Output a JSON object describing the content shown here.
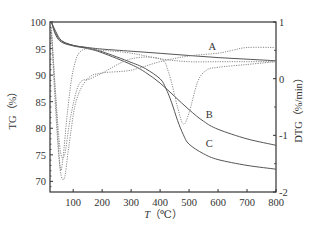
{
  "chart_data": {
    "type": "line",
    "title": "",
    "xlabel": "T (℃)",
    "ylabel": "TG (%)",
    "y2label": "DTG (%/min)",
    "xlim": [
      20,
      800
    ],
    "ylim": [
      68,
      100
    ],
    "y2lim": [
      -2,
      1
    ],
    "grid": false,
    "legend": "inline curve labels A, B, C",
    "x_ticks": [
      100,
      200,
      300,
      400,
      500,
      600,
      700,
      800
    ],
    "y_ticks": [
      70,
      75,
      80,
      85,
      90,
      95,
      100
    ],
    "y2_ticks": [
      -2,
      -1,
      0,
      1
    ],
    "series": [
      {
        "name": "A",
        "axis": "TG",
        "style": "solid",
        "x": [
          25,
          40,
          60,
          100,
          150,
          200,
          300,
          400,
          500,
          600,
          700,
          800
        ],
        "y": [
          100,
          98.2,
          96.5,
          95.6,
          95.2,
          94.9,
          94.5,
          94.1,
          93.7,
          93.3,
          93.0,
          92.7
        ]
      },
      {
        "name": "B",
        "axis": "TG",
        "style": "solid",
        "x": [
          25,
          40,
          60,
          100,
          150,
          200,
          300,
          350,
          400,
          450,
          500,
          550,
          600,
          700,
          800
        ],
        "y": [
          100,
          97.5,
          96.2,
          95.5,
          95.0,
          94.2,
          92.0,
          90.5,
          88.5,
          86.0,
          83.5,
          81.3,
          79.8,
          78.0,
          76.8
        ]
      },
      {
        "name": "C",
        "axis": "TG",
        "style": "solid",
        "x": [
          25,
          40,
          60,
          100,
          150,
          200,
          300,
          350,
          400,
          420,
          440,
          460,
          480,
          500,
          550,
          600,
          700,
          800
        ],
        "y": [
          100,
          97.8,
          96.4,
          95.6,
          95.1,
          94.4,
          92.4,
          91.2,
          89.3,
          87.5,
          84.8,
          81.5,
          78.8,
          77.0,
          75.2,
          74.1,
          73.0,
          72.3
        ]
      },
      {
        "name": "DTG-A",
        "axis": "DTG",
        "style": "dotted",
        "x": [
          25,
          40,
          55,
          65,
          80,
          100,
          130,
          200,
          300,
          400,
          500,
          600,
          700,
          800
        ],
        "y": [
          0.9,
          -0.4,
          -1.55,
          -1.4,
          -0.6,
          0.15,
          0.5,
          0.5,
          0.45,
          0.35,
          0.3,
          0.3,
          0.3,
          0.3
        ]
      },
      {
        "name": "DTG-B",
        "axis": "DTG",
        "style": "dotted",
        "x": [
          25,
          40,
          55,
          70,
          85,
          110,
          150,
          200,
          300,
          400,
          500,
          600,
          650,
          700,
          800
        ],
        "y": [
          0.8,
          -0.6,
          -1.6,
          -1.75,
          -1.2,
          -0.4,
          0.0,
          0.1,
          0.15,
          0.3,
          0.4,
          0.45,
          0.5,
          0.55,
          0.55
        ]
      },
      {
        "name": "DTG-C",
        "axis": "DTG",
        "style": "dotted",
        "x": [
          25,
          40,
          55,
          70,
          90,
          120,
          160,
          200,
          300,
          400,
          430,
          460,
          480,
          500,
          530,
          560,
          600,
          700,
          800
        ],
        "y": [
          0.85,
          -0.3,
          -1.25,
          -1.35,
          -0.7,
          -0.1,
          0.0,
          0.1,
          0.35,
          0.35,
          0.1,
          -0.5,
          -0.8,
          -0.6,
          -0.05,
          0.15,
          0.2,
          0.25,
          0.3
        ]
      }
    ],
    "annotations": [
      {
        "text": "A",
        "x": 580,
        "y_tg": 94.8
      },
      {
        "text": "B",
        "x": 570,
        "y_tg": 82.0
      },
      {
        "text": "C",
        "x": 570,
        "y_tg": 76.5
      }
    ]
  },
  "labels": {
    "ylabel_left": "TG（%）",
    "ylabel_right": "DTG（%/min）",
    "xlabel_italic": "T",
    "xlabel_unit": "（℃）",
    "curve_a": "A",
    "curve_b": "B",
    "curve_c": "C"
  }
}
